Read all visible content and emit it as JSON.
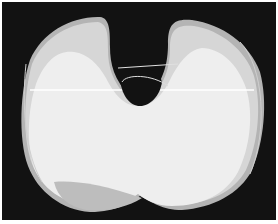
{
  "image": {
    "description": "Grayscale photograph of overlapping knee implant tibial component outlines on a dark background",
    "background_color": "#121212",
    "shape_colors": {
      "light": "#eeeeee",
      "mid": "#d6d6d6",
      "dark": "#b4b4b4"
    }
  }
}
